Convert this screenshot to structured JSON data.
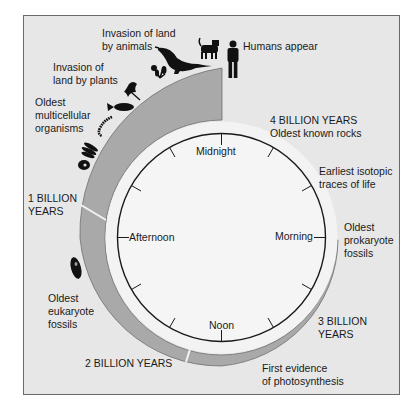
{
  "diagram": {
    "type": "geologic-clock",
    "colors": {
      "background": "#e7e7e7",
      "frame_border": "#6a6a6a",
      "band": "#a9a9a9",
      "ring": "#f3f3f3",
      "clock_face": "#f5f5f5",
      "ink": "#1a1a1a"
    },
    "clock": {
      "labels": {
        "top": "Midnight",
        "right": "Morning",
        "bottom": "Noon",
        "left": "Afternoon"
      },
      "tick_count": 12
    },
    "milestones": {
      "four_billion": "4 BILLION YEARS\nOldest known rocks",
      "isotopic": "Earliest isotopic\ntraces of life",
      "prokaryote": "Oldest\nprokaryote\nfossils",
      "three_billion": "3 BILLION\nYEARS",
      "photosynthesis": "First evidence\nof photosynthesis",
      "two_billion": "2 BILLION YEARS",
      "eukaryote": "Oldest\neukaryote\nfossils",
      "one_billion": "1 BILLION\nYEARS",
      "multicellular": "Oldest\nmulticellular\norganisms",
      "plants": "Invasion of\nland by plants",
      "animals": "Invasion of land\nby animals",
      "humans": "Humans appear"
    },
    "icons": [
      "algae-icon",
      "seaweed-icon",
      "worm-icon",
      "fish-icon",
      "plant-icon",
      "flower-icon",
      "dinosaur-icon",
      "dog-icon",
      "human-icon",
      "eukaryote-cell-icon"
    ]
  }
}
